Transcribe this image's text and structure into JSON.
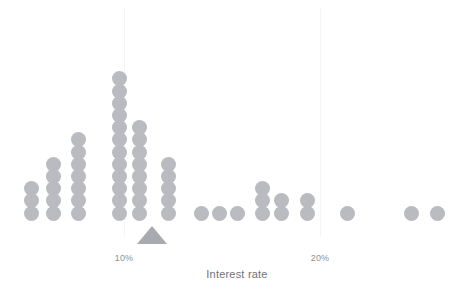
{
  "chart_data": {
    "type": "bar",
    "chart_style": "dot-plot",
    "title": "",
    "subtitle": "",
    "xlabel": "Interest rate",
    "ylabel": "",
    "grid": "vertical-only",
    "legend": "none",
    "unit_note": "each dot represents one observation",
    "xlim": [
      5.0,
      26.0
    ],
    "ylim": [
      0,
      12
    ],
    "xticks": [
      10,
      20
    ],
    "xtick_labels": [
      "10%",
      "20%"
    ],
    "categories": [
      "6%",
      "7%",
      "8%",
      "10%",
      "11%",
      "12%",
      "14%",
      "15%",
      "16%",
      "17%",
      "18%",
      "19%",
      "21%",
      "24%",
      "25%"
    ],
    "values": [
      3,
      5,
      7,
      12,
      8,
      5,
      1,
      1,
      1,
      3,
      2,
      2,
      1,
      1,
      1
    ],
    "annotations": [
      {
        "name": "median-marker",
        "shape": "triangle",
        "x": 11.5,
        "label": ""
      }
    ],
    "colors": {
      "dot": "#b9bbc0",
      "marker": "#a8aaaf",
      "gridline": "#f4f5f7",
      "tick_text": "#8e9196",
      "axis_title_text": "#6f7378",
      "background": "#ffffff"
    }
  },
  "axis": {
    "ticks": [
      {
        "label": "10%",
        "x": 124
      },
      {
        "label": "20%",
        "x": 320
      }
    ],
    "title": "Interest rate"
  },
  "columns": [
    {
      "name": "column-1",
      "x": 31,
      "dots": 3
    },
    {
      "name": "column-2",
      "x": 53,
      "dots": 5
    },
    {
      "name": "column-3",
      "x": 78,
      "dots": 7
    },
    {
      "name": "column-4",
      "x": 119,
      "dots": 12
    },
    {
      "name": "column-5",
      "x": 139,
      "dots": 8
    },
    {
      "name": "column-6",
      "x": 168,
      "dots": 5
    },
    {
      "name": "column-7",
      "x": 201,
      "dots": 1
    },
    {
      "name": "column-8",
      "x": 219,
      "dots": 1
    },
    {
      "name": "column-9",
      "x": 237,
      "dots": 1
    },
    {
      "name": "column-10",
      "x": 262,
      "dots": 3
    },
    {
      "name": "column-11",
      "x": 281,
      "dots": 2
    },
    {
      "name": "column-12",
      "x": 307,
      "dots": 2
    },
    {
      "name": "column-13",
      "x": 347,
      "dots": 1
    },
    {
      "name": "column-14",
      "x": 411,
      "dots": 1
    },
    {
      "name": "column-15",
      "x": 437,
      "dots": 1
    }
  ],
  "gridlines": [
    {
      "name": "gridline-10pct",
      "x": 124
    },
    {
      "name": "gridline-20pct",
      "x": 320
    }
  ],
  "marker": {
    "name": "median-marker",
    "x": 152,
    "y": 226
  },
  "geometry": {
    "dot_diameter": 15,
    "dot_pitch": 12.2,
    "baseline_y": 213,
    "grid_top": 8,
    "grid_height": 228
  }
}
